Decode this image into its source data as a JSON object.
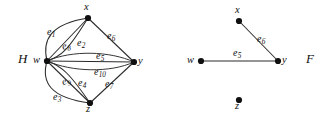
{
  "figure": {
    "background_color": "#ffffff",
    "stroke_color": "#2b2b2b",
    "text_color": "#111111"
  },
  "graphs": [
    {
      "id": "H",
      "name": "H",
      "name_pos": {
        "x": 18,
        "y": 52
      },
      "vertices": [
        {
          "id": "w",
          "label": "w",
          "x": 47,
          "y": 61,
          "label_pos": {
            "x": 33,
            "y": 55
          }
        },
        {
          "id": "x",
          "label": "x",
          "x": 88,
          "y": 18,
          "label_pos": {
            "x": 84,
            "y": 2
          }
        },
        {
          "id": "y",
          "label": "y",
          "x": 134,
          "y": 62,
          "label_pos": {
            "x": 138,
            "y": 56
          }
        },
        {
          "id": "z",
          "label": "z",
          "x": 90,
          "y": 103,
          "label_pos": {
            "x": 86,
            "y": 104
          }
        }
      ],
      "edges": [
        {
          "id": "e1",
          "label": "e",
          "sub": "1",
          "from": "w",
          "to": "x",
          "label_pos": {
            "x": 47,
            "y": 27
          }
        },
        {
          "id": "e8",
          "label": "e",
          "sub": "8",
          "from": "w",
          "to": "x",
          "label_pos": {
            "x": 62,
            "y": 41
          }
        },
        {
          "id": "e2",
          "label": "e",
          "sub": "2",
          "from": "w",
          "to": "x",
          "label_pos": {
            "x": 77,
            "y": 38
          }
        },
        {
          "id": "e6",
          "label": "e",
          "sub": "6",
          "from": "x",
          "to": "y",
          "label_pos": {
            "x": 107,
            "y": 31
          }
        },
        {
          "id": "e5",
          "label": "e",
          "sub": "5",
          "from": "w",
          "to": "y",
          "label_pos": {
            "x": 96,
            "y": 51
          }
        },
        {
          "id": "e10",
          "label": "e",
          "sub": "10",
          "from": "w",
          "to": "y",
          "label_pos": {
            "x": 94,
            "y": 67
          }
        },
        {
          "id": "e9",
          "label": "e",
          "sub": "9",
          "from": "w",
          "to": "z",
          "label_pos": {
            "x": 62,
            "y": 76
          }
        },
        {
          "id": "e4",
          "label": "e",
          "sub": "4",
          "from": "w",
          "to": "z",
          "label_pos": {
            "x": 78,
            "y": 78
          }
        },
        {
          "id": "e3",
          "label": "e",
          "sub": "3",
          "from": "w",
          "to": "z",
          "label_pos": {
            "x": 53,
            "y": 92
          }
        },
        {
          "id": "e7",
          "label": "e",
          "sub": "7",
          "from": "y",
          "to": "z",
          "label_pos": {
            "x": 105,
            "y": 79
          }
        }
      ]
    },
    {
      "id": "F",
      "name": "F",
      "name_pos": {
        "x": 306,
        "y": 52
      },
      "vertices": [
        {
          "id": "w",
          "label": "w",
          "x": 201,
          "y": 61,
          "label_pos": {
            "x": 187,
            "y": 55
          }
        },
        {
          "id": "x",
          "label": "x",
          "x": 239,
          "y": 21,
          "label_pos": {
            "x": 235,
            "y": 5
          }
        },
        {
          "id": "y",
          "label": "y",
          "x": 278,
          "y": 61,
          "label_pos": {
            "x": 282,
            "y": 55
          }
        },
        {
          "id": "z",
          "label": "z",
          "x": 239,
          "y": 100,
          "label_pos": {
            "x": 235,
            "y": 101
          }
        }
      ],
      "edges": [
        {
          "id": "e6",
          "label": "e",
          "sub": "6",
          "from": "x",
          "to": "y",
          "label_pos": {
            "x": 257,
            "y": 34
          }
        },
        {
          "id": "e5",
          "label": "e",
          "sub": "5",
          "from": "w",
          "to": "y",
          "label_pos": {
            "x": 233,
            "y": 48
          }
        }
      ]
    }
  ],
  "edge_paths": {
    "H": {
      "e1": "M 47 61 C 42 40 50 24 88 18",
      "e8": "M 47 61 C 62 56 68 50 88 18",
      "e2": "M 47 61 L 88 18",
      "e6": "M 88 18 L 134 62",
      "e5": "M 47 61 C 72 50 110 51 134 62",
      "e10": "M 47 61 C 72 72 110 73 134 62",
      "e9": "M 47 61 C 62 66 70 74 90 103",
      "e4": "M 47 61 L 90 103",
      "e3": "M 47 61 C 41 82 50 98 90 103",
      "e7": "M 134 62 L 90 103"
    },
    "F": {
      "e6": "M 239 21 L 278 61",
      "e5": "M 201 61 L 278 61"
    }
  }
}
